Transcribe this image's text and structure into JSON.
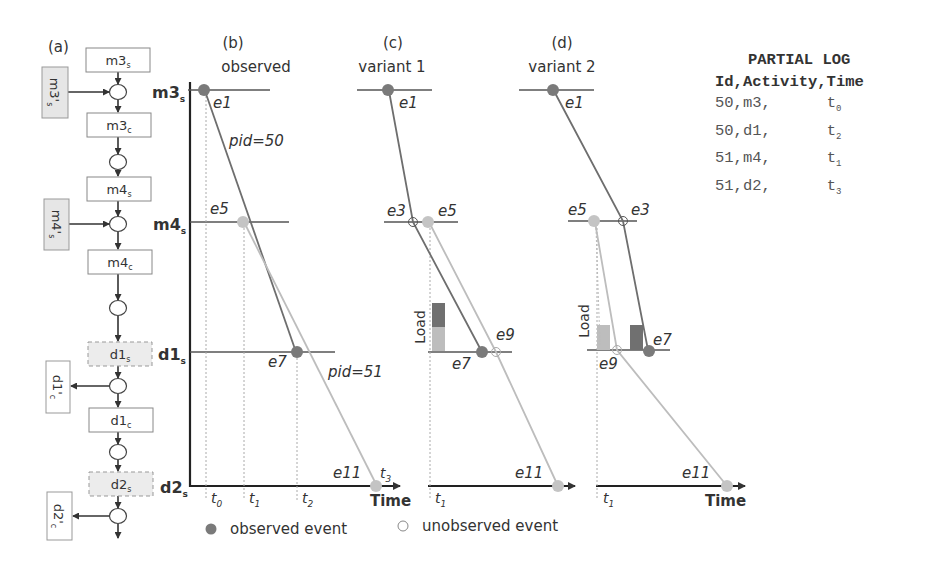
{
  "panels": {
    "a": {
      "label": "(a)"
    },
    "b": {
      "label": "(b)",
      "title": "observed"
    },
    "c": {
      "label": "(c)",
      "title": "variant 1"
    },
    "d": {
      "label": "(d)",
      "title": "variant 2"
    }
  },
  "flow": {
    "boxes": [
      {
        "id": "m3s",
        "base": "m3",
        "sub": "s",
        "style": "solid"
      },
      {
        "id": "m3c",
        "base": "m3",
        "sub": "c",
        "style": "solid"
      },
      {
        "id": "m4s",
        "base": "m4",
        "sub": "s",
        "style": "solid"
      },
      {
        "id": "m4c",
        "base": "m4",
        "sub": "c",
        "style": "solid"
      },
      {
        "id": "d1s",
        "base": "d1",
        "sub": "s",
        "style": "dashed-shaded"
      },
      {
        "id": "d1c",
        "base": "d1",
        "sub": "c",
        "style": "solid"
      },
      {
        "id": "d2s",
        "base": "d2",
        "sub": "s",
        "style": "dashed-shaded"
      }
    ],
    "side_boxes": [
      {
        "id": "m3prime_s",
        "base": "m3'",
        "sub": "s",
        "direction": "in",
        "shaded": true
      },
      {
        "id": "m4prime_s",
        "base": "m4'",
        "sub": "s",
        "direction": "in",
        "shaded": true
      },
      {
        "id": "d1prime_c",
        "base": "d1'",
        "sub": "c",
        "direction": "out",
        "shaded": false
      },
      {
        "id": "d2prime_c",
        "base": "d2'",
        "sub": "c",
        "direction": "out",
        "shaded": false
      }
    ]
  },
  "axis": {
    "levels": [
      {
        "base": "m3",
        "sub": "s"
      },
      {
        "base": "m4",
        "sub": "s"
      },
      {
        "base": "d1",
        "sub": "s"
      },
      {
        "base": "d2",
        "sub": "s"
      }
    ],
    "time_label": "Time",
    "load_label": "Load"
  },
  "observed": {
    "events": [
      "e1",
      "e5",
      "e7",
      "e11"
    ],
    "pid_labels": [
      "pid=50",
      "pid=51"
    ],
    "ticks": [
      {
        "base": "t",
        "sub": "0"
      },
      {
        "base": "t",
        "sub": "1"
      },
      {
        "base": "t",
        "sub": "2"
      },
      {
        "base": "t",
        "sub": "3"
      }
    ]
  },
  "variant1": {
    "events": [
      "e1",
      "e3",
      "e5",
      "e7",
      "e9",
      "e11"
    ],
    "ticks": [
      {
        "base": "t",
        "sub": "1"
      }
    ]
  },
  "variant2": {
    "events": [
      "e1",
      "e5",
      "e3",
      "e9",
      "e7",
      "e11"
    ],
    "ticks": [
      {
        "base": "t",
        "sub": "1"
      }
    ]
  },
  "legend": {
    "observed": "observed event",
    "unobserved": "unobserved event"
  },
  "log": {
    "title": "PARTIAL LOG",
    "header": "Id,Activity,Time",
    "rows": [
      {
        "id": "50",
        "activity": "m3",
        "time_base": "t",
        "time_sub": "0"
      },
      {
        "id": "50",
        "activity": "d1",
        "time_base": "t",
        "time_sub": "2"
      },
      {
        "id": "51",
        "activity": "m4",
        "time_base": "t",
        "time_sub": "1"
      },
      {
        "id": "51",
        "activity": "d2",
        "time_base": "t",
        "time_sub": "3"
      }
    ]
  },
  "colors": {
    "pid50": "#6e6e6e",
    "pid51": "#bdbdbd",
    "observed_dark": "#7a7a7a",
    "observed_light": "#c4c4c4",
    "axis": "#222222",
    "load_dark": "#707070",
    "load_light": "#bdbdbd",
    "shaded_box": "#ececec"
  }
}
